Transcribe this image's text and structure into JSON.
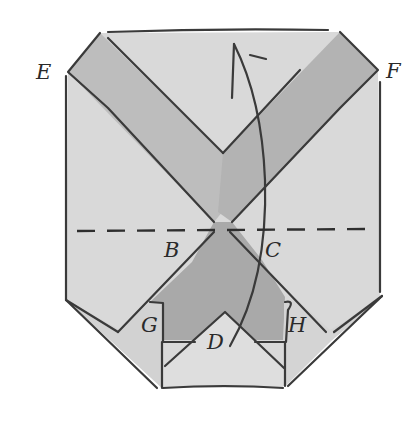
{
  "diagram": {
    "type": "origami folding step",
    "labels": {
      "E": "E",
      "F": "F",
      "B": "B",
      "C": "C",
      "G": "G",
      "D": "D",
      "H": "H"
    },
    "fold_line": "dashed horizontal valley fold through B and C",
    "arrow": "curved arrow pointing upward (fold up)",
    "colors": {
      "paper_light": "#dcdcdc",
      "paper_band": "#b9b9b9",
      "paper_dark": "#a6a6a6",
      "ink": "#3a3a3a",
      "background": "#ffffff"
    }
  }
}
